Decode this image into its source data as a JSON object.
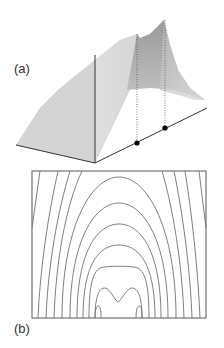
{
  "figure": {
    "panel_a": {
      "label": "(a)",
      "description": "3D surface plot with two peaks projected onto baseline",
      "marked_points": 2
    },
    "panel_b": {
      "label": "(b)",
      "description": "Contour plot of the surface",
      "contour_count": 12
    }
  },
  "colors": {
    "surface_light": "#d6d6d6",
    "surface_dark": "#a8a8a8",
    "axis": "#333333",
    "contour": "#707070",
    "point": "#000000"
  }
}
